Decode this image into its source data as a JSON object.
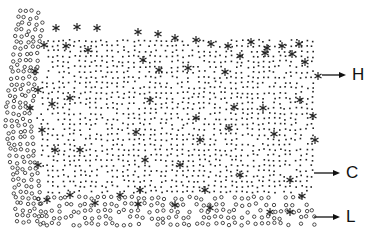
{
  "figure": {
    "legend_symbols": {
      "circle": "open-circle",
      "dot": "small-dot",
      "asterisk": "asterisk"
    },
    "labels": [
      {
        "id": "H",
        "text": "H",
        "arrow_y": 75,
        "arrow_x1": 322,
        "arrow_x2": 346,
        "text_x": 352
      },
      {
        "id": "C",
        "text": "C",
        "arrow_y": 173,
        "arrow_x1": 314,
        "arrow_x2": 340,
        "text_x": 346
      },
      {
        "id": "L",
        "text": "L",
        "arrow_y": 217,
        "arrow_x1": 314,
        "arrow_x2": 340,
        "text_x": 346
      }
    ],
    "colors": {
      "ink": "#222222",
      "background": "#ffffff"
    }
  }
}
